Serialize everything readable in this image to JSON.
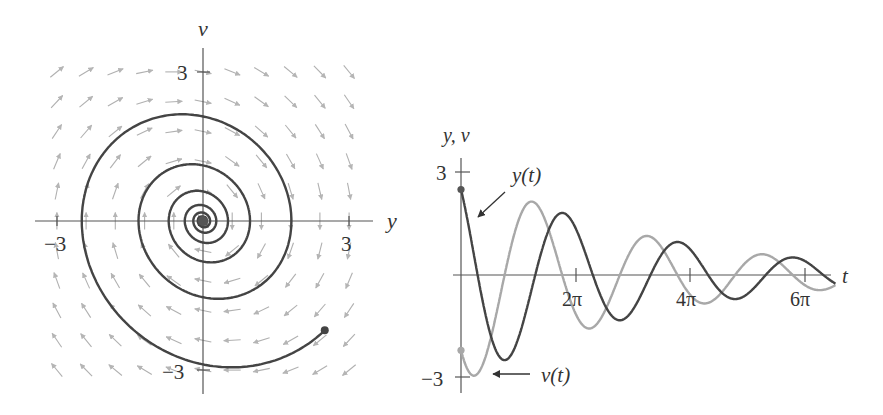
{
  "chart_data": [
    {
      "type": "line",
      "name": "phase-plane",
      "title": "",
      "xlabel": "y",
      "ylabel": "v",
      "xlim": [
        -3.2,
        3.2
      ],
      "ylim": [
        -3.2,
        3.2
      ],
      "x_ticks": [
        {
          "value": -3,
          "label": "−3"
        },
        {
          "value": 3,
          "label": "3"
        }
      ],
      "y_ticks": [
        {
          "value": 3,
          "label": "3"
        },
        {
          "value": -3,
          "label": "−3"
        }
      ],
      "grid": false,
      "system": {
        "dy_dt": "v",
        "dv_dt": "-y - 0.2 v"
      },
      "direction_field": {
        "y_range": [
          -3,
          3
        ],
        "v_range": [
          -3,
          3
        ],
        "spacing": 0.6,
        "color": "#b0b0b0"
      },
      "series": [
        {
          "name": "solution-curve",
          "initial": {
            "y": 2.5,
            "v": -2.2
          },
          "t_range": [
            0,
            60
          ],
          "color": "#444444",
          "start_marker": true
        }
      ]
    },
    {
      "type": "line",
      "name": "time-series",
      "title": "",
      "xlabel": "t",
      "ylabel": "y, v",
      "xlim": [
        0,
        20.5
      ],
      "ylim": [
        -3,
        3
      ],
      "x_ticks": [
        {
          "value": 6.2832,
          "label": "2π"
        },
        {
          "value": 12.5664,
          "label": "4π"
        },
        {
          "value": 18.8496,
          "label": "6π"
        }
      ],
      "y_ticks": [
        {
          "value": 3,
          "label": "3"
        },
        {
          "value": -3,
          "label": "−3"
        }
      ],
      "grid": false,
      "series": [
        {
          "name": "y(t)",
          "initial_value": 2.5,
          "color": "#444444",
          "annotation": "y(t)"
        },
        {
          "name": "v(t)",
          "initial_value": -2.2,
          "color": "#a8a8a8",
          "annotation": "v(t)"
        }
      ],
      "sample_points": {
        "t": [
          0,
          1.57,
          3.14,
          4.71,
          6.28,
          9.42,
          12.57,
          15.71,
          18.85
        ],
        "y": [
          2.5,
          -1.9,
          -1.6,
          0.8,
          1.3,
          -0.9,
          0.5,
          -0.4,
          0.3
        ],
        "v": [
          -2.2,
          -2.7,
          1.3,
          2.1,
          -0.6,
          -1.1,
          0.7,
          0.5,
          -0.3
        ]
      }
    }
  ],
  "labels": {
    "left_v_axis": "v",
    "left_y_axis": "y",
    "left_tick_pos": "3",
    "left_tick_neg": "−3",
    "left_vtick_pos": "3",
    "left_vtick_neg": "−3",
    "right_axis": "y, v",
    "right_t_axis": "t",
    "right_tick_pos": "3",
    "right_tick_neg": "−3",
    "tick_2pi": "2π",
    "tick_4pi": "4π",
    "tick_6pi": "6π",
    "ann_y": "y(t)",
    "ann_v": "v(t)"
  },
  "colors": {
    "axis": "#555555",
    "curve_dark": "#444444",
    "curve_light": "#a8a8a8",
    "arrows": "#b5b5b5"
  }
}
